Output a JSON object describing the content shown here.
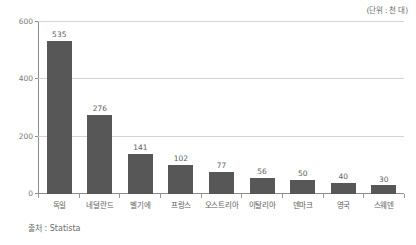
{
  "unit_note": "(단위 : 천 대)",
  "source_note": "출처 : Statista",
  "chart_data": {
    "type": "bar",
    "title": "",
    "subtitle": "",
    "xlabel": "",
    "ylabel": "",
    "unit_label": "(단위 : 천 대)",
    "source": "출처 : Statista",
    "categories": [
      "독일",
      "네덜란드",
      "벨기에",
      "프랑스",
      "오스트리아",
      "이탈리아",
      "덴마크",
      "영국",
      "스웨덴"
    ],
    "values": [
      535,
      276,
      141,
      102,
      77,
      56,
      50,
      40,
      30
    ],
    "value_labels": [
      "535",
      "276",
      "141",
      "102",
      "77",
      "56",
      "50",
      "40",
      "30"
    ],
    "ylim": [
      0,
      600
    ],
    "yticks": [
      0,
      200,
      400,
      600
    ],
    "ytick_labels": [
      "0",
      "200",
      "400",
      "600"
    ],
    "grid": true,
    "grid_axis": "y",
    "legend": false,
    "bar_color": "#575757",
    "grid_color": "#d3d3d3",
    "axis_color": "#8c8c8c",
    "text_color": "#5e5e5e",
    "background": "#ffffff"
  }
}
